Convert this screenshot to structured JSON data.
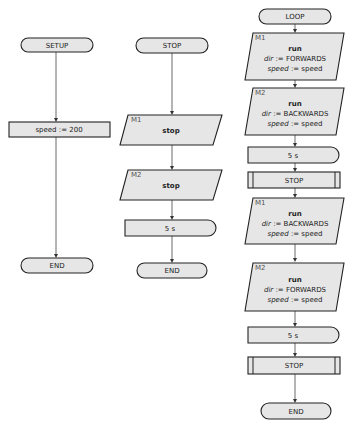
{
  "diagram": {
    "columns": [
      {
        "name": "setup",
        "nodes": [
          {
            "type": "terminator",
            "label": "SETUP"
          },
          {
            "type": "process",
            "label": "speed := 200"
          },
          {
            "type": "terminator",
            "label": "END"
          }
        ]
      },
      {
        "name": "stop",
        "nodes": [
          {
            "type": "terminator",
            "label": "STOP"
          },
          {
            "type": "io",
            "tag": "M1",
            "lines": [
              "stop"
            ]
          },
          {
            "type": "io",
            "tag": "M2",
            "lines": [
              "stop"
            ]
          },
          {
            "type": "delay",
            "label": "5 s"
          },
          {
            "type": "terminator",
            "label": "END"
          }
        ]
      },
      {
        "name": "loop",
        "nodes": [
          {
            "type": "terminator",
            "label": "LOOP"
          },
          {
            "type": "io",
            "tag": "M1",
            "lines": [
              "run",
              "dir := FORWARDS",
              "speed := speed"
            ]
          },
          {
            "type": "io",
            "tag": "M2",
            "lines": [
              "run",
              "dir := BACKWARDS",
              "speed := speed"
            ]
          },
          {
            "type": "delay",
            "label": "5 s"
          },
          {
            "type": "subroutine",
            "label": "STOP"
          },
          {
            "type": "io",
            "tag": "M1",
            "lines": [
              "run",
              "dir := BACKWARDS",
              "speed := speed"
            ]
          },
          {
            "type": "io",
            "tag": "M2",
            "lines": [
              "run",
              "dir := FORWARDS",
              "speed := speed"
            ]
          },
          {
            "type": "delay",
            "label": "5 s"
          },
          {
            "type": "subroutine",
            "label": "STOP"
          },
          {
            "type": "terminator",
            "label": "END"
          }
        ]
      }
    ],
    "run_word": "run",
    "dir_var": "dir",
    "speed_var": "speed",
    "assign_op": " := ",
    "values": {
      "forwards": "FORWARDS",
      "backwards": "BACKWARDS",
      "speed": "speed"
    },
    "colors": {
      "fill": "#e6e6e6",
      "stroke": "#222222",
      "line": "#444444"
    }
  }
}
